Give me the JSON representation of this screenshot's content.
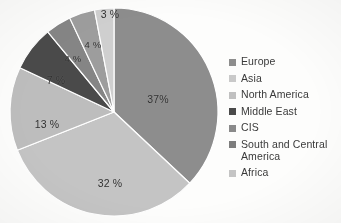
{
  "chart_data": {
    "type": "pie",
    "title": "",
    "subtitle": "",
    "xlabel": "",
    "ylabel": "",
    "grid": false,
    "legend_position": "right",
    "start_angle_deg": 0,
    "direction": "clockwise",
    "categories": [
      "Europe",
      "Asia",
      "North America",
      "Middle East",
      "CIS",
      "South and Central America",
      "Africa"
    ],
    "values": [
      37,
      32,
      13,
      7,
      4,
      4,
      3
    ],
    "value_labels": [
      "37%",
      "32 %",
      "13 %",
      "7 %",
      "4 %",
      "4 %",
      "3 %"
    ],
    "colors": [
      "#8d8d8d",
      "#c4c4c4",
      "#bdbdbd",
      "#4a4a4a",
      "#858585",
      "#9d9d9d",
      "#cfcfcf"
    ],
    "slices": [
      {
        "label": "Europe",
        "value": 37,
        "value_label": "37%",
        "color": "#8d8d8d",
        "label_x": 158,
        "label_y": 99,
        "label_size": "normal"
      },
      {
        "label": "Asia",
        "value": 32,
        "value_label": "32 %",
        "color": "#c4c4c4",
        "label_x": 110,
        "label_y": 183,
        "label_size": "normal"
      },
      {
        "label": "North America",
        "value": 13,
        "value_label": "13 %",
        "color": "#bdbdbd",
        "label_x": 47,
        "label_y": 124,
        "label_size": "normal"
      },
      {
        "label": "Middle East",
        "value": 7,
        "value_label": "7 %",
        "color": "#4a4a4a",
        "label_x": 56,
        "label_y": 80,
        "label_size": "normal"
      },
      {
        "label": "CIS",
        "value": 4,
        "value_label": "4 %",
        "color": "#858585",
        "label_x": 73,
        "label_y": 58,
        "label_size": "small"
      },
      {
        "label": "South and Central America",
        "value": 4,
        "value_label": "4 %",
        "color": "#9d9d9d",
        "label_x": 93,
        "label_y": 44,
        "label_size": "small"
      },
      {
        "label": "Africa",
        "value": 3,
        "value_label": "3 %",
        "color": "#cfcfcf",
        "label_x": 110,
        "label_y": 14,
        "label_size": "normal"
      }
    ],
    "geometry": {
      "center_x": 114,
      "center_y": 112,
      "radius": 104
    }
  },
  "legend": {
    "items": [
      {
        "label": "Europe",
        "color": "#8d8d8d"
      },
      {
        "label": "Asia",
        "color": "#c9c9c9"
      },
      {
        "label": "North America",
        "color": "#c0c0c0"
      },
      {
        "label": "Middle East",
        "color": "#4a4a4a"
      },
      {
        "label": "CIS",
        "color": "#8a8a8a"
      },
      {
        "label": "South and Central America",
        "color": "#7d7d7d"
      },
      {
        "label": "Africa",
        "color": "#c4c4c4"
      }
    ]
  }
}
